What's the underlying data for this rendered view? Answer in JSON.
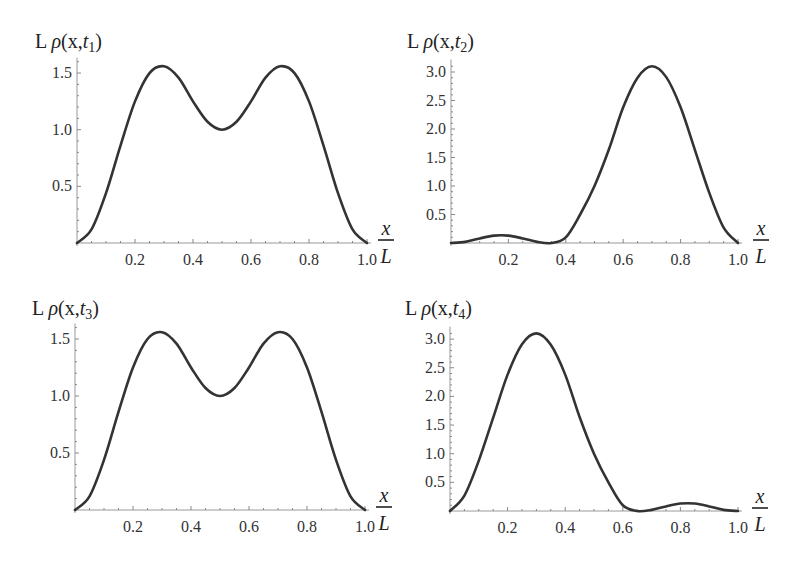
{
  "chart_data": [
    {
      "type": "line",
      "title": "L ρ(x,t1)",
      "title_parts": {
        "prefix": "L ",
        "rho": "ρ",
        "args": "(x,",
        "t": "t",
        "sub": "1",
        "close": ")"
      },
      "xlabel": "x/L",
      "ylabel": "L ρ(x,t1)",
      "xlim": [
        0,
        1.0
      ],
      "ylim": [
        0,
        1.6
      ],
      "xticks": [
        "0.2",
        "0.4",
        "0.6",
        "0.8",
        "1.0"
      ],
      "yticks": [
        "0.5",
        "1.0",
        "1.5"
      ],
      "x": [
        0,
        0.05,
        0.1,
        0.15,
        0.2,
        0.25,
        0.3,
        0.35,
        0.4,
        0.45,
        0.5,
        0.55,
        0.6,
        0.65,
        0.7,
        0.75,
        0.8,
        0.85,
        0.9,
        0.95,
        1.0
      ],
      "values": [
        0,
        0.12,
        0.44,
        0.86,
        1.25,
        1.5,
        1.56,
        1.46,
        1.25,
        1.07,
        1.0,
        1.07,
        1.25,
        1.46,
        1.56,
        1.5,
        1.25,
        0.86,
        0.44,
        0.12,
        0
      ],
      "grid": false
    },
    {
      "type": "line",
      "title": "L ρ(x,t2)",
      "title_parts": {
        "prefix": "L ",
        "rho": "ρ",
        "args": "(x,",
        "t": "t",
        "sub": "2",
        "close": ")"
      },
      "xlabel": "x/L",
      "ylabel": "L ρ(x,t2)",
      "xlim": [
        0,
        1.0
      ],
      "ylim": [
        0,
        3.15
      ],
      "xticks": [
        "0.2",
        "0.4",
        "0.6",
        "0.8",
        "1.0"
      ],
      "yticks": [
        "0.5",
        "1.0",
        "1.5",
        "2.0",
        "2.5",
        "3.0"
      ],
      "x": [
        0,
        0.05,
        0.1,
        0.15,
        0.2,
        0.25,
        0.3,
        0.35,
        0.4,
        0.45,
        0.5,
        0.55,
        0.6,
        0.65,
        0.7,
        0.75,
        0.8,
        0.85,
        0.9,
        0.95,
        1.0
      ],
      "values": [
        0,
        0.02,
        0.08,
        0.13,
        0.13,
        0.08,
        0.02,
        0.0,
        0.1,
        0.5,
        1.0,
        1.64,
        2.38,
        2.9,
        3.1,
        2.91,
        2.38,
        1.63,
        0.88,
        0.27,
        0
      ],
      "grid": false
    },
    {
      "type": "line",
      "title": "L ρ(x,t3)",
      "title_parts": {
        "prefix": "L ",
        "rho": "ρ",
        "args": "(x,",
        "t": "t",
        "sub": "3",
        "close": ")"
      },
      "xlabel": "x/L",
      "ylabel": "L ρ(x,t3)",
      "xlim": [
        0,
        1.0
      ],
      "ylim": [
        0,
        1.6
      ],
      "xticks": [
        "0.2",
        "0.4",
        "0.6",
        "0.8",
        "1.0"
      ],
      "yticks": [
        "0.5",
        "1.0",
        "1.5"
      ],
      "x": [
        0,
        0.05,
        0.1,
        0.15,
        0.2,
        0.25,
        0.3,
        0.35,
        0.4,
        0.45,
        0.5,
        0.55,
        0.6,
        0.65,
        0.7,
        0.75,
        0.8,
        0.85,
        0.9,
        0.95,
        1.0
      ],
      "values": [
        0,
        0.12,
        0.44,
        0.86,
        1.25,
        1.5,
        1.56,
        1.46,
        1.25,
        1.07,
        1.0,
        1.07,
        1.25,
        1.46,
        1.56,
        1.5,
        1.25,
        0.86,
        0.44,
        0.12,
        0
      ],
      "grid": false
    },
    {
      "type": "line",
      "title": "L ρ(x,t4)",
      "title_parts": {
        "prefix": "L ",
        "rho": "ρ",
        "args": "(x,",
        "t": "t",
        "sub": "4",
        "close": ")"
      },
      "xlabel": "x/L",
      "ylabel": "L ρ(x,t4)",
      "xlim": [
        0,
        1.0
      ],
      "ylim": [
        0,
        3.15
      ],
      "xticks": [
        "0.2",
        "0.4",
        "0.6",
        "0.8",
        "1.0"
      ],
      "yticks": [
        "0.5",
        "1.0",
        "1.5",
        "2.0",
        "2.5",
        "3.0"
      ],
      "x": [
        0,
        0.05,
        0.1,
        0.15,
        0.2,
        0.25,
        0.3,
        0.35,
        0.4,
        0.45,
        0.5,
        0.55,
        0.6,
        0.65,
        0.7,
        0.75,
        0.8,
        0.85,
        0.9,
        0.95,
        1.0
      ],
      "values": [
        0,
        0.27,
        0.88,
        1.63,
        2.38,
        2.91,
        3.1,
        2.9,
        2.38,
        1.64,
        1.0,
        0.5,
        0.1,
        0.0,
        0.02,
        0.08,
        0.13,
        0.13,
        0.08,
        0.02,
        0
      ],
      "grid": false
    }
  ],
  "axis_label": {
    "x_num": "x",
    "x_den": "L"
  }
}
